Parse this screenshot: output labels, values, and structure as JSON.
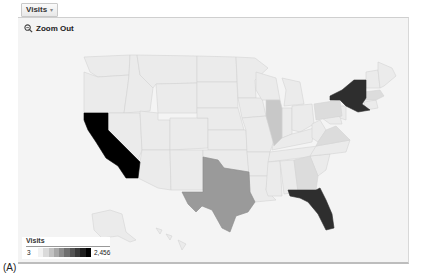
{
  "metric_selector": {
    "label": "Visits",
    "caret": "▾"
  },
  "map_controls": {
    "zoom_out_label": "Zoom Out",
    "zoom_icon": "magnifier-icon"
  },
  "legend": {
    "title": "Visits",
    "min": "3",
    "max": "2,456",
    "gradient": [
      "#f2f2f2",
      "#dadada",
      "#c2c2c2",
      "#a8a8a8",
      "#8c8c8c",
      "#707070",
      "#545454",
      "#3a3a3a",
      "#1e1e1e",
      "#000000"
    ]
  },
  "caption": "(A)",
  "colors": {
    "panel_bg": "#f4f4f4",
    "state_default": "#ebebeb",
    "state_border": "#d6d6d6",
    "highest": "#000000",
    "high": "#2e2e2e",
    "medium": "#9a9a9a",
    "low": "#c8c8c8",
    "low_light": "#dcdcdc"
  },
  "states_highlighted": [
    {
      "name": "California",
      "level": "highest"
    },
    {
      "name": "New York",
      "level": "high"
    },
    {
      "name": "Florida",
      "level": "high"
    },
    {
      "name": "Texas",
      "level": "medium"
    },
    {
      "name": "Illinois",
      "level": "low"
    },
    {
      "name": "Pennsylvania",
      "level": "low_light"
    },
    {
      "name": "Massachusetts",
      "level": "low_light"
    },
    {
      "name": "Virginia",
      "level": "low_light"
    },
    {
      "name": "Georgia",
      "level": "low_light"
    }
  ]
}
